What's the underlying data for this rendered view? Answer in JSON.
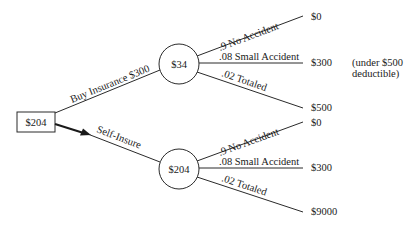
{
  "diagram": {
    "type": "decision-tree",
    "decision_node": {
      "value": "$204"
    },
    "branches": [
      {
        "label": "Buy Insurance $300",
        "chance_node": {
          "value": "$34"
        },
        "outcomes": [
          {
            "label": ".9 No Accident",
            "payoff": "$0"
          },
          {
            "label": ".08 Small Accident",
            "payoff": "$300"
          },
          {
            "label": ".02 Totaled",
            "payoff": "$500"
          }
        ],
        "note_line1": "(under $500",
        "note_line2": "deductible)"
      },
      {
        "label": "Self-Insure",
        "chosen": true,
        "chance_node": {
          "value": "$204"
        },
        "outcomes": [
          {
            "label": ".9 No Accident",
            "payoff": "$0"
          },
          {
            "label": ".08 Small Accident",
            "payoff": "$300"
          },
          {
            "label": ".02 Totaled",
            "payoff": "$9000"
          }
        ]
      }
    ]
  }
}
